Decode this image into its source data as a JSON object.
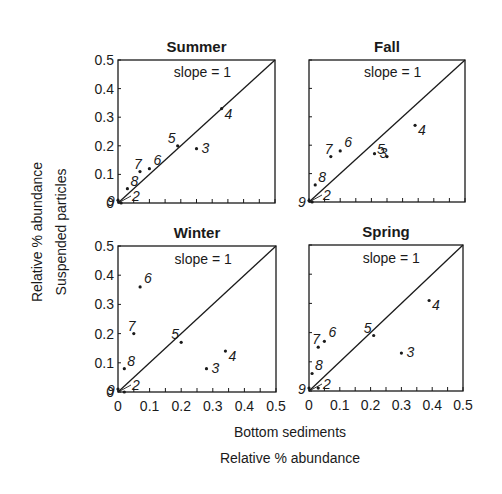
{
  "chart_data": {
    "type": "scatter",
    "title": "",
    "xlabel": [
      "Bottom sediments",
      "Relative % abundance"
    ],
    "ylabel": [
      "Relative % abundance",
      "Suspended particles"
    ],
    "xlim": [
      0,
      0.5
    ],
    "ylim": [
      0,
      0.5
    ],
    "x_ticks": [
      "0",
      "0.1",
      "0.2",
      "0.3",
      "0.4",
      "0.5"
    ],
    "y_ticks": [
      "0",
      "0.1",
      "0.2",
      "0.3",
      "0.4",
      "0.5"
    ],
    "reference_line": {
      "label": "slope = 1",
      "slope": 1
    },
    "grid": false,
    "panels": [
      {
        "name": "Summer",
        "points": [
          {
            "label": "2",
            "x": 0.01,
            "y": 0.0
          },
          {
            "label": "3",
            "x": 0.25,
            "y": 0.19
          },
          {
            "label": "4",
            "x": 0.33,
            "y": 0.33
          },
          {
            "label": "5",
            "x": 0.19,
            "y": 0.2
          },
          {
            "label": "6",
            "x": 0.1,
            "y": 0.12
          },
          {
            "label": "7",
            "x": 0.07,
            "y": 0.11
          },
          {
            "label": "8",
            "x": 0.03,
            "y": 0.05
          },
          {
            "label": "9",
            "x": 0.0,
            "y": 0.01
          }
        ]
      },
      {
        "name": "Fall",
        "points": [
          {
            "label": "2",
            "x": 0.01,
            "y": 0.0
          },
          {
            "label": "3",
            "x": 0.21,
            "y": 0.17
          },
          {
            "label": "4",
            "x": 0.34,
            "y": 0.27
          },
          {
            "label": "5",
            "x": 0.25,
            "y": 0.16
          },
          {
            "label": "6",
            "x": 0.1,
            "y": 0.18
          },
          {
            "label": "7",
            "x": 0.07,
            "y": 0.16
          },
          {
            "label": "8",
            "x": 0.02,
            "y": 0.06
          },
          {
            "label": "9",
            "x": 0.0,
            "y": 0.005
          }
        ]
      },
      {
        "name": "Winter",
        "points": [
          {
            "label": "2",
            "x": 0.02,
            "y": 0.0
          },
          {
            "label": "3",
            "x": 0.28,
            "y": 0.08
          },
          {
            "label": "4",
            "x": 0.34,
            "y": 0.14
          },
          {
            "label": "5",
            "x": 0.2,
            "y": 0.17
          },
          {
            "label": "6",
            "x": 0.07,
            "y": 0.36
          },
          {
            "label": "7",
            "x": 0.05,
            "y": 0.2
          },
          {
            "label": "8",
            "x": 0.02,
            "y": 0.08
          },
          {
            "label": "9",
            "x": 0.0,
            "y": 0.01
          }
        ]
      },
      {
        "name": "Spring",
        "points": [
          {
            "label": "2",
            "x": 0.03,
            "y": 0.01
          },
          {
            "label": "3",
            "x": 0.3,
            "y": 0.13
          },
          {
            "label": "4",
            "x": 0.39,
            "y": 0.31
          },
          {
            "label": "5",
            "x": 0.21,
            "y": 0.19
          },
          {
            "label": "6",
            "x": 0.05,
            "y": 0.17
          },
          {
            "label": "7",
            "x": 0.03,
            "y": 0.15
          },
          {
            "label": "8",
            "x": 0.01,
            "y": 0.06
          },
          {
            "label": "9",
            "x": 0.0,
            "y": 0.01
          }
        ]
      }
    ]
  },
  "labels": {
    "x_axis_line1": "Bottom sediments",
    "x_axis_line2": "Relative % abundance",
    "y_axis_line1": "Relative % abundance",
    "y_axis_line2": "Suspended particles",
    "slope": "slope = 1"
  },
  "colors": {
    "ink": "#1a1a1a",
    "background": "#ffffff"
  }
}
